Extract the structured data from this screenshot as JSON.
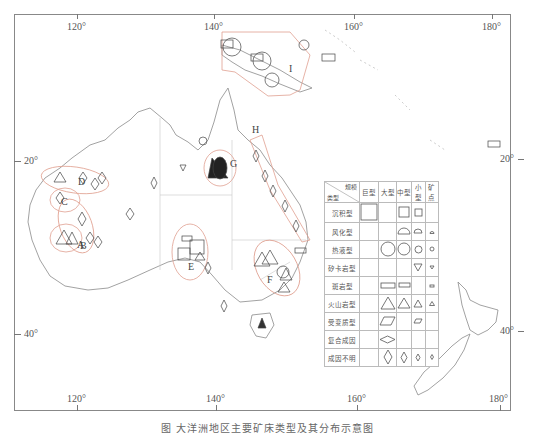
{
  "map": {
    "axes": {
      "top_longitude_labels": [
        "120°",
        "140°",
        "160°",
        "180°"
      ],
      "bottom_longitude_labels": [
        "120°",
        "140°",
        "160°",
        "180°"
      ],
      "left_latitude_labels": [
        "20°",
        "40°"
      ],
      "right_latitude_labels": [
        "20°",
        "40°"
      ]
    },
    "regions": [
      {
        "id": "A",
        "label": "A"
      },
      {
        "id": "B",
        "label": "B"
      },
      {
        "id": "C",
        "label": "C"
      },
      {
        "id": "D",
        "label": "D"
      },
      {
        "id": "E",
        "label": "E"
      },
      {
        "id": "F",
        "label": "F"
      },
      {
        "id": "G",
        "label": "G"
      },
      {
        "id": "H",
        "label": "H"
      },
      {
        "id": "I",
        "label": "I"
      }
    ],
    "colors": {
      "coast": "#8a8a8a",
      "region_outline": "#e0a090",
      "symbol": "#444444"
    }
  },
  "legend": {
    "header_top": "规模",
    "header_bottom": "类型",
    "columns": [
      "巨型",
      "大型",
      "中型",
      "小型",
      "矿点"
    ],
    "rows": [
      {
        "type": "沉积型",
        "symbol": "square",
        "sizes": [
          "巨型",
          "中型",
          "小型"
        ]
      },
      {
        "type": "风化型",
        "symbol": "semicircle",
        "sizes": [
          "中型",
          "小型",
          "矿点"
        ]
      },
      {
        "type": "热液型",
        "symbol": "circle",
        "sizes": [
          "大型",
          "中型",
          "小型",
          "矿点"
        ]
      },
      {
        "type": "矽卡岩型",
        "symbol": "inverted-triangle",
        "sizes": [
          "小型",
          "矿点"
        ]
      },
      {
        "type": "斑岩型",
        "symbol": "rectangle",
        "sizes": [
          "大型",
          "中型",
          "矿点"
        ]
      },
      {
        "type": "火山岩型",
        "symbol": "triangle",
        "sizes": [
          "大型",
          "中型",
          "小型",
          "矿点"
        ]
      },
      {
        "type": "受变质型",
        "symbol": "parallelogram",
        "sizes": [
          "大型",
          "小型"
        ]
      },
      {
        "type": "复合成因",
        "symbol": "horizontal-diamond",
        "sizes": [
          "大型"
        ]
      },
      {
        "type": "成因不明",
        "symbol": "diamond",
        "sizes": [
          "大型",
          "中型",
          "小型",
          "矿点"
        ]
      }
    ]
  },
  "caption": "图    大洋洲地区主要矿床类型及其分布示意图"
}
